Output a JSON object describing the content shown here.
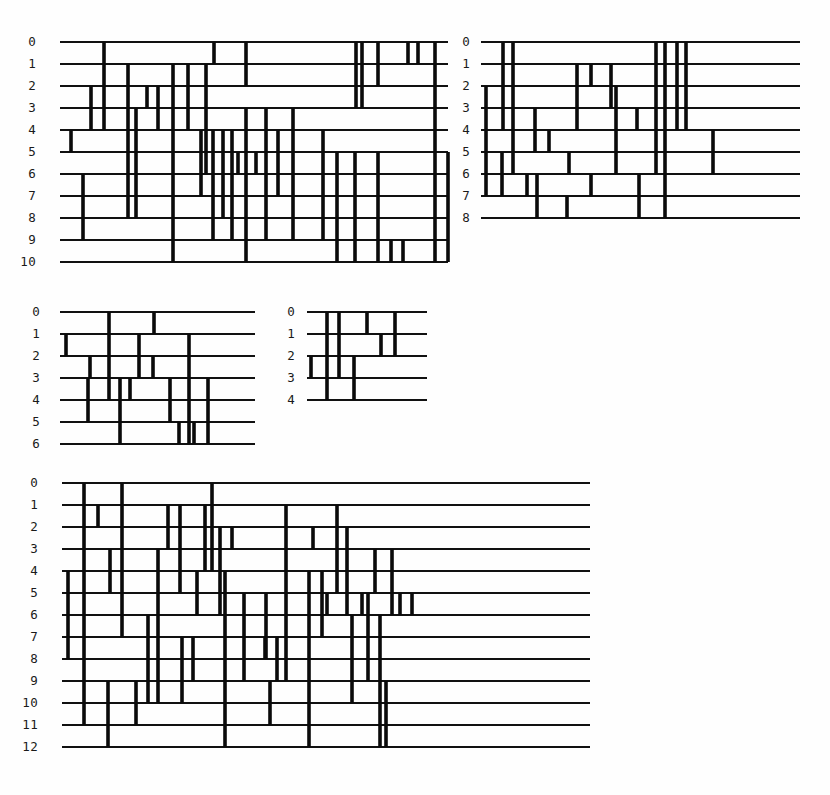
{
  "figure": {
    "background_color": "#fefefe",
    "rail_color": "#111111",
    "rung_color": "#0a0a0a",
    "label_color": "#1a1a1a",
    "panel_count": 4
  },
  "chart_data": {
    "type": "diagram",
    "title": "",
    "xlabel": "",
    "ylabel": "",
    "panels": [
      {
        "id": "panel-top-left",
        "row_labels": [
          "0",
          "1",
          "2",
          "3",
          "4",
          "5",
          "6",
          "7",
          "8",
          "9",
          "10"
        ],
        "row_count": 11,
        "x": 60,
        "y": 42,
        "width": 388,
        "row_gap": 22,
        "label_x": 36,
        "rails": [
          {
            "row": 0,
            "x0": 0,
            "x1": 388
          },
          {
            "row": 1,
            "x0": 0,
            "x1": 388
          },
          {
            "row": 2,
            "x0": 0,
            "x1": 388
          },
          {
            "row": 3,
            "x0": 0,
            "x1": 388
          },
          {
            "row": 4,
            "x0": 0,
            "x1": 388
          },
          {
            "row": 5,
            "x0": 0,
            "x1": 388
          },
          {
            "row": 6,
            "x0": 0,
            "x1": 388
          },
          {
            "row": 7,
            "x0": 0,
            "x1": 388
          },
          {
            "row": 8,
            "x0": 0,
            "x1": 388
          },
          {
            "row": 9,
            "x0": 0,
            "x1": 388
          },
          {
            "row": 10,
            "x0": 0,
            "x1": 388
          }
        ],
        "rungs": [
          {
            "x": 44,
            "r0": 0,
            "r1": 4
          },
          {
            "x": 154,
            "r0": 0,
            "r1": 1
          },
          {
            "x": 186,
            "r0": 0,
            "r1": 2
          },
          {
            "x": 296,
            "r0": 0,
            "r1": 3
          },
          {
            "x": 302,
            "r0": 0,
            "r1": 3
          },
          {
            "x": 318,
            "r0": 0,
            "r1": 2
          },
          {
            "x": 348,
            "r0": 0,
            "r1": 1
          },
          {
            "x": 358,
            "r0": 0,
            "r1": 1
          },
          {
            "x": 375,
            "r0": 0,
            "r1": 5
          },
          {
            "x": 31,
            "r0": 2,
            "r1": 4
          },
          {
            "x": 68,
            "r0": 1,
            "r1": 8
          },
          {
            "x": 87,
            "r0": 2,
            "r1": 3
          },
          {
            "x": 98,
            "r0": 2,
            "r1": 4
          },
          {
            "x": 113,
            "r0": 1,
            "r1": 10
          },
          {
            "x": 128,
            "r0": 1,
            "r1": 4
          },
          {
            "x": 146,
            "r0": 1,
            "r1": 6
          },
          {
            "x": 76,
            "r0": 3,
            "r1": 8
          },
          {
            "x": 11,
            "r0": 4,
            "r1": 5
          },
          {
            "x": 141,
            "r0": 4,
            "r1": 7
          },
          {
            "x": 153,
            "r0": 4,
            "r1": 9
          },
          {
            "x": 163,
            "r0": 4,
            "r1": 8
          },
          {
            "x": 172,
            "r0": 4,
            "r1": 9
          },
          {
            "x": 186,
            "r0": 3,
            "r1": 10
          },
          {
            "x": 206,
            "r0": 3,
            "r1": 9
          },
          {
            "x": 218,
            "r0": 4,
            "r1": 7
          },
          {
            "x": 233,
            "r0": 3,
            "r1": 9
          },
          {
            "x": 178,
            "r0": 5,
            "r1": 6
          },
          {
            "x": 196,
            "r0": 5,
            "r1": 6
          },
          {
            "x": 23,
            "r0": 6,
            "r1": 9
          },
          {
            "x": 263,
            "r0": 4,
            "r1": 9
          },
          {
            "x": 277,
            "r0": 5,
            "r1": 10
          },
          {
            "x": 295,
            "r0": 5,
            "r1": 10
          },
          {
            "x": 318,
            "r0": 5,
            "r1": 10
          },
          {
            "x": 331,
            "r0": 9,
            "r1": 10
          },
          {
            "x": 343,
            "r0": 9,
            "r1": 10
          },
          {
            "x": 375,
            "r0": 5,
            "r1": 10
          },
          {
            "x": 388,
            "r0": 5,
            "r1": 10
          }
        ]
      },
      {
        "id": "panel-top-right",
        "row_labels": [
          "0",
          "1",
          "2",
          "3",
          "4",
          "5",
          "6",
          "7",
          "8"
        ],
        "row_count": 9,
        "x": 481,
        "y": 42,
        "width": 319,
        "row_gap": 22,
        "label_x": 470,
        "rails": [
          {
            "row": 0,
            "x0": 0,
            "x1": 319
          },
          {
            "row": 1,
            "x0": 0,
            "x1": 319
          },
          {
            "row": 2,
            "x0": 0,
            "x1": 319
          },
          {
            "row": 3,
            "x0": 0,
            "x1": 319
          },
          {
            "row": 4,
            "x0": 0,
            "x1": 319
          },
          {
            "row": 5,
            "x0": 0,
            "x1": 319
          },
          {
            "row": 6,
            "x0": 0,
            "x1": 319
          },
          {
            "row": 7,
            "x0": 0,
            "x1": 319
          },
          {
            "row": 8,
            "x0": 0,
            "x1": 319
          }
        ],
        "rungs": [
          {
            "x": 22,
            "r0": 0,
            "r1": 4
          },
          {
            "x": 32,
            "r0": 0,
            "r1": 6
          },
          {
            "x": 96,
            "r0": 1,
            "r1": 4
          },
          {
            "x": 110,
            "r0": 1,
            "r1": 2
          },
          {
            "x": 130,
            "r0": 1,
            "r1": 3
          },
          {
            "x": 175,
            "r0": 0,
            "r1": 6
          },
          {
            "x": 184,
            "r0": 0,
            "r1": 8
          },
          {
            "x": 196,
            "r0": 0,
            "r1": 4
          },
          {
            "x": 205,
            "r0": 0,
            "r1": 4
          },
          {
            "x": 5,
            "r0": 2,
            "r1": 7
          },
          {
            "x": 54,
            "r0": 3,
            "r1": 5
          },
          {
            "x": 135,
            "r0": 2,
            "r1": 6
          },
          {
            "x": 156,
            "r0": 3,
            "r1": 4
          },
          {
            "x": 68,
            "r0": 4,
            "r1": 5
          },
          {
            "x": 232,
            "r0": 4,
            "r1": 6
          },
          {
            "x": 21,
            "r0": 5,
            "r1": 7
          },
          {
            "x": 88,
            "r0": 5,
            "r1": 6
          },
          {
            "x": 46,
            "r0": 6,
            "r1": 7
          },
          {
            "x": 56,
            "r0": 6,
            "r1": 8
          },
          {
            "x": 110,
            "r0": 6,
            "r1": 7
          },
          {
            "x": 86,
            "r0": 7,
            "r1": 8
          },
          {
            "x": 158,
            "r0": 6,
            "r1": 8
          }
        ]
      },
      {
        "id": "panel-mid-left",
        "row_labels": [
          "0",
          "1",
          "2",
          "3",
          "4",
          "5",
          "6"
        ],
        "row_count": 7,
        "x": 60,
        "y": 312,
        "width": 195,
        "row_gap": 22,
        "label_x": 40,
        "rails": [
          {
            "row": 0,
            "x0": 0,
            "x1": 195
          },
          {
            "row": 1,
            "x0": 0,
            "x1": 195
          },
          {
            "row": 2,
            "x0": 0,
            "x1": 195
          },
          {
            "row": 3,
            "x0": 0,
            "x1": 195
          },
          {
            "row": 4,
            "x0": 0,
            "x1": 195
          },
          {
            "row": 5,
            "x0": 0,
            "x1": 195
          },
          {
            "row": 6,
            "x0": 0,
            "x1": 195
          }
        ],
        "rungs": [
          {
            "x": 49,
            "r0": 0,
            "r1": 4
          },
          {
            "x": 94,
            "r0": 0,
            "r1": 1
          },
          {
            "x": 6,
            "r0": 1,
            "r1": 2
          },
          {
            "x": 79,
            "r0": 1,
            "r1": 3
          },
          {
            "x": 129,
            "r0": 1,
            "r1": 6
          },
          {
            "x": 30,
            "r0": 2,
            "r1": 3
          },
          {
            "x": 93,
            "r0": 2,
            "r1": 3
          },
          {
            "x": 28,
            "r0": 3,
            "r1": 5
          },
          {
            "x": 60,
            "r0": 3,
            "r1": 6
          },
          {
            "x": 70,
            "r0": 3,
            "r1": 4
          },
          {
            "x": 110,
            "r0": 3,
            "r1": 5
          },
          {
            "x": 148,
            "r0": 3,
            "r1": 6
          },
          {
            "x": 119,
            "r0": 5,
            "r1": 6
          },
          {
            "x": 134,
            "r0": 5,
            "r1": 6
          }
        ]
      },
      {
        "id": "panel-mid-right",
        "row_labels": [
          "0",
          "1",
          "2",
          "3",
          "4"
        ],
        "row_count": 5,
        "x": 307,
        "y": 312,
        "width": 120,
        "row_gap": 22,
        "label_x": 295,
        "rails": [
          {
            "row": 0,
            "x0": 0,
            "x1": 120
          },
          {
            "row": 1,
            "x0": 0,
            "x1": 120
          },
          {
            "row": 2,
            "x0": 0,
            "x1": 120
          },
          {
            "row": 3,
            "x0": 0,
            "x1": 120
          },
          {
            "row": 4,
            "x0": 0,
            "x1": 120
          }
        ],
        "rungs": [
          {
            "x": 20,
            "r0": 0,
            "r1": 4
          },
          {
            "x": 32,
            "r0": 0,
            "r1": 3
          },
          {
            "x": 60,
            "r0": 0,
            "r1": 1
          },
          {
            "x": 88,
            "r0": 0,
            "r1": 2
          },
          {
            "x": 74,
            "r0": 1,
            "r1": 2
          },
          {
            "x": 4,
            "r0": 2,
            "r1": 3
          },
          {
            "x": 47,
            "r0": 2,
            "r1": 4
          }
        ]
      },
      {
        "id": "panel-bottom",
        "row_labels": [
          "0",
          "1",
          "2",
          "3",
          "4",
          "5",
          "6",
          "7",
          "8",
          "9",
          "10",
          "11",
          "12"
        ],
        "row_count": 13,
        "x": 62,
        "y": 483,
        "width": 528,
        "row_gap": 22,
        "label_x": 38,
        "rails": [
          {
            "row": 0,
            "x0": 0,
            "x1": 528
          },
          {
            "row": 1,
            "x0": 0,
            "x1": 528
          },
          {
            "row": 2,
            "x0": 0,
            "x1": 528
          },
          {
            "row": 3,
            "x0": 0,
            "x1": 528
          },
          {
            "row": 4,
            "x0": 0,
            "x1": 528
          },
          {
            "row": 5,
            "x0": 0,
            "x1": 528
          },
          {
            "row": 6,
            "x0": 0,
            "x1": 528
          },
          {
            "row": 7,
            "x0": 0,
            "x1": 528
          },
          {
            "row": 8,
            "x0": 0,
            "x1": 528
          },
          {
            "row": 9,
            "x0": 0,
            "x1": 528
          },
          {
            "row": 10,
            "x0": 0,
            "x1": 528
          },
          {
            "row": 11,
            "x0": 0,
            "x1": 528
          },
          {
            "row": 12,
            "x0": 0,
            "x1": 528
          }
        ],
        "rungs": [
          {
            "x": 22,
            "r0": 0,
            "r1": 11
          },
          {
            "x": 60,
            "r0": 0,
            "r1": 7
          },
          {
            "x": 150,
            "r0": 0,
            "r1": 4
          },
          {
            "x": 36,
            "r0": 1,
            "r1": 2
          },
          {
            "x": 106,
            "r0": 1,
            "r1": 3
          },
          {
            "x": 118,
            "r0": 1,
            "r1": 5
          },
          {
            "x": 143,
            "r0": 1,
            "r1": 4
          },
          {
            "x": 224,
            "r0": 1,
            "r1": 9
          },
          {
            "x": 275,
            "r0": 1,
            "r1": 5
          },
          {
            "x": 158,
            "r0": 2,
            "r1": 6
          },
          {
            "x": 170,
            "r0": 2,
            "r1": 3
          },
          {
            "x": 251,
            "r0": 2,
            "r1": 3
          },
          {
            "x": 285,
            "r0": 2,
            "r1": 6
          },
          {
            "x": 48,
            "r0": 3,
            "r1": 5
          },
          {
            "x": 96,
            "r0": 3,
            "r1": 10
          },
          {
            "x": 313,
            "r0": 3,
            "r1": 5
          },
          {
            "x": 330,
            "r0": 3,
            "r1": 6
          },
          {
            "x": 6,
            "r0": 4,
            "r1": 8
          },
          {
            "x": 135,
            "r0": 4,
            "r1": 6
          },
          {
            "x": 163,
            "r0": 4,
            "r1": 12
          },
          {
            "x": 247,
            "r0": 4,
            "r1": 12
          },
          {
            "x": 260,
            "r0": 4,
            "r1": 7
          },
          {
            "x": 182,
            "r0": 5,
            "r1": 9
          },
          {
            "x": 204,
            "r0": 5,
            "r1": 8
          },
          {
            "x": 265,
            "r0": 5,
            "r1": 6
          },
          {
            "x": 300,
            "r0": 5,
            "r1": 6
          },
          {
            "x": 306,
            "r0": 5,
            "r1": 9
          },
          {
            "x": 338,
            "r0": 5,
            "r1": 6
          },
          {
            "x": 350,
            "r0": 5,
            "r1": 6
          },
          {
            "x": 86,
            "r0": 6,
            "r1": 10
          },
          {
            "x": 290,
            "r0": 6,
            "r1": 9
          },
          {
            "x": 318,
            "r0": 6,
            "r1": 12
          },
          {
            "x": 120,
            "r0": 7,
            "r1": 10
          },
          {
            "x": 131,
            "r0": 7,
            "r1": 9
          },
          {
            "x": 203,
            "r0": 7,
            "r1": 8
          },
          {
            "x": 215,
            "r0": 7,
            "r1": 9
          },
          {
            "x": 46,
            "r0": 9,
            "r1": 12
          },
          {
            "x": 74,
            "r0": 9,
            "r1": 11
          },
          {
            "x": 208,
            "r0": 9,
            "r1": 11
          },
          {
            "x": 290,
            "r0": 9,
            "r1": 10
          },
          {
            "x": 324,
            "r0": 9,
            "r1": 12
          }
        ]
      }
    ]
  }
}
